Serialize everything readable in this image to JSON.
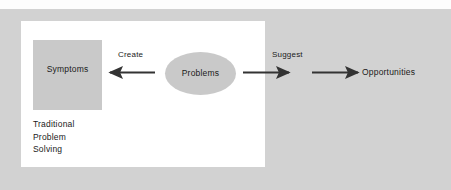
{
  "figure": {
    "top_title": "",
    "caption_lines": [
      "Traditional",
      "Problem",
      "Solving"
    ]
  },
  "nodes": {
    "symptoms": {
      "label": "Symptoms",
      "shape": "rectangle",
      "fill": "#c9c9c9"
    },
    "problems": {
      "label": "Problems",
      "shape": "ellipse",
      "fill": "#c9c9c9"
    },
    "opportunities": {
      "label": "Opportunities",
      "shape": "text"
    }
  },
  "edges": [
    {
      "id": "create",
      "label": "Create",
      "from": "problems",
      "to": "symptoms",
      "direction": "left",
      "color": "#333333"
    },
    {
      "id": "suggest",
      "label": "Suggest",
      "from": "problems",
      "to": "opportunities-stage",
      "direction": "right",
      "color": "#333333"
    },
    {
      "id": "to-opportunities",
      "label": "",
      "from": "midpoint",
      "to": "opportunities",
      "direction": "right",
      "color": "#333333"
    }
  ],
  "colors": {
    "outer_field": "#d2d2d2",
    "panel": "#ffffff",
    "node_fill": "#c9c9c9",
    "text": "#1a1a1a",
    "arrow": "#333333"
  }
}
